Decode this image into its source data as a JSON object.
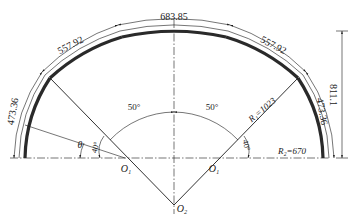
{
  "diagram": {
    "type": "engineering drawing - three-centred arch section",
    "dimensions": {
      "top_arc_length": "683.85",
      "upper_left_arc_length": "557.92",
      "upper_right_arc_length": "557.92",
      "lower_left_arc_length": "473.36",
      "lower_right_arc_length": "473.36",
      "total_height": "811.1"
    },
    "angles": {
      "left_central": "50°",
      "right_central": "50°",
      "left_base": "40°",
      "right_base": "40°",
      "theta": "θ"
    },
    "radii": {
      "R1": "R₁=1023",
      "R2": "R₂=670"
    },
    "centers": {
      "O1_left": "O₁",
      "O1_right": "O₁",
      "O2": "O₂"
    },
    "colors": {
      "line": "#1a1a1a",
      "background": "#ffffff"
    }
  }
}
